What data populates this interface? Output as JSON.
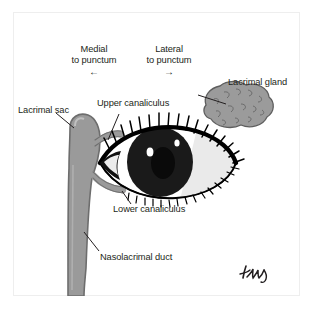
{
  "figure": {
    "background_color": "#ffffff",
    "frame_color": "#eeeeee",
    "ink_color": "#231f20",
    "gland_fill": "#9b9b9b",
    "sac_fill": "#9a9a9a",
    "sac_outline": "#6d6d6d",
    "iris_fill": "#1a1a1a",
    "sclera_fill": "#ffffff",
    "sclera_shadow": "#e8e8e8"
  },
  "orientation": {
    "medial": {
      "line1": "Medial",
      "line2": "to punctum",
      "arrow": "←",
      "arrow_name": "left-arrow-icon"
    },
    "lateral": {
      "line1": "Lateral",
      "line2": "to punctum",
      "arrow": "→",
      "arrow_name": "right-arrow-icon"
    }
  },
  "labels": [
    {
      "id": "lacrimal-gland",
      "text": "Lacrimal gland"
    },
    {
      "id": "upper-canaliculus",
      "text": "Upper canaliculus"
    },
    {
      "id": "lacrimal-sac",
      "text": "Lacrimal sac"
    },
    {
      "id": "lower-canaliculus",
      "text": "Lower canaliculus"
    },
    {
      "id": "nasolacrimal-duct",
      "text": "Nasolacrimal duct"
    }
  ],
  "signature": {
    "present": true,
    "legible": false,
    "description": "handwritten artist signature"
  },
  "caption": {
    "text": "",
    "legible": false
  }
}
